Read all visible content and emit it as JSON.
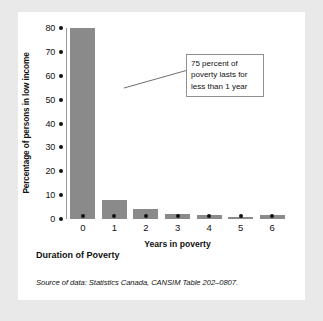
{
  "figure": {
    "title": "Duration of Poverty",
    "source": "Source of data: Statistics Canada, CANSIM Table 202–0807.",
    "callout": "75 percent of poverty lasts for less than 1 year"
  },
  "chart_data": {
    "type": "bar",
    "title": "Duration of Poverty",
    "xlabel": "Years in poverty",
    "ylabel": "Percentage of persons in low income",
    "categories": [
      "0",
      "1",
      "2",
      "3",
      "4",
      "5",
      "6"
    ],
    "values": [
      80,
      8,
      4,
      2,
      1.5,
      1,
      1.5
    ],
    "ylim": [
      0,
      80
    ],
    "yticks": [
      80,
      70,
      60,
      50,
      40,
      30,
      20,
      10,
      0
    ],
    "grid": false,
    "legend": null,
    "bar_color": "#8a8a8a",
    "annotations": [
      {
        "text": "75 percent of poverty lasts for less than 1 year",
        "points_to_category": "0"
      }
    ]
  },
  "colors": {
    "page_background": "#e9e9e9",
    "card_background": "#ffffff",
    "bar": "#8a8a8a",
    "axis": "#9a9a9a",
    "text": "#111111"
  }
}
